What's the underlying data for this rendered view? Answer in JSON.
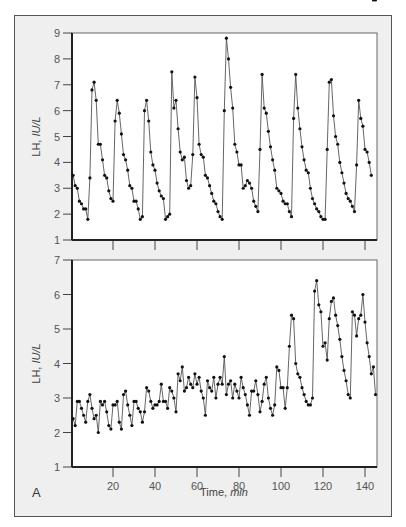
{
  "panel_label": "A",
  "colors": {
    "frame_bg": "#efefef",
    "plot_bg": "#ffffff",
    "line": "#555555",
    "marker": "#111111",
    "axis": "#222222"
  },
  "chart_data": [
    {
      "type": "line",
      "title": "",
      "xlabel": "",
      "ylabel": "LH, IU/L",
      "xlim": [
        0,
        145
      ],
      "ylim": [
        1,
        9
      ],
      "yticks": [
        1,
        2,
        3,
        4,
        5,
        6,
        7,
        8,
        9
      ],
      "xticks": [
        20,
        40,
        60,
        80,
        100,
        120,
        140
      ],
      "x": [
        1,
        2,
        3,
        4,
        5,
        6,
        7,
        8,
        9,
        10,
        11,
        12,
        13,
        14,
        15,
        16,
        17,
        18,
        19,
        20,
        21,
        22,
        23,
        24,
        25,
        26,
        27,
        28,
        29,
        30,
        31,
        32,
        33,
        34,
        35,
        36,
        37,
        38,
        39,
        40,
        41,
        42,
        43,
        44,
        45,
        46,
        47,
        48,
        49,
        50,
        51,
        52,
        53,
        54,
        55,
        56,
        57,
        58,
        59,
        60,
        61,
        62,
        63,
        64,
        65,
        66,
        67,
        68,
        69,
        70,
        71,
        72,
        73,
        74,
        75,
        76,
        77,
        78,
        79,
        80,
        81,
        82,
        83,
        84,
        85,
        86,
        87,
        88,
        89,
        90,
        91,
        92,
        93,
        94,
        95,
        96,
        97,
        98,
        99,
        100,
        101,
        102,
        103,
        104,
        105,
        106,
        107,
        108,
        109,
        110,
        111,
        112,
        113,
        114,
        115,
        116,
        117,
        118,
        119,
        120,
        121,
        122,
        123,
        124,
        125,
        126,
        127,
        128,
        129,
        130,
        131,
        132,
        133,
        134,
        135,
        136,
        137,
        138,
        139,
        140,
        141,
        142,
        143,
        144,
        145
      ],
      "series": [
        {
          "name": "LH",
          "values": [
            3.5,
            3.1,
            3.0,
            2.5,
            2.4,
            2.2,
            2.2,
            1.8,
            3.4,
            6.8,
            7.1,
            6.4,
            4.7,
            4.7,
            4.1,
            3.5,
            3.4,
            2.9,
            2.6,
            2.5,
            5.6,
            6.4,
            5.9,
            5.1,
            4.3,
            4.1,
            3.7,
            3.1,
            3.0,
            2.5,
            2.5,
            2.2,
            1.8,
            1.9,
            6.0,
            6.4,
            5.6,
            4.4,
            3.9,
            3.7,
            3.2,
            2.9,
            2.7,
            2.6,
            1.8,
            1.9,
            2.0,
            7.5,
            6.1,
            6.4,
            5.3,
            4.4,
            4.1,
            4.2,
            3.3,
            3.0,
            3.1,
            4.3,
            7.3,
            6.5,
            4.7,
            4.3,
            4.2,
            3.5,
            3.4,
            3.1,
            2.8,
            2.5,
            2.4,
            2.1,
            1.9,
            1.8,
            6.0,
            8.8,
            8.0,
            6.9,
            6.1,
            4.7,
            4.4,
            3.9,
            3.9,
            3.0,
            3.1,
            3.3,
            3.2,
            3.0,
            2.5,
            2.3,
            2.1,
            4.5,
            7.4,
            6.1,
            5.9,
            5.2,
            4.6,
            4.1,
            3.7,
            3.0,
            2.9,
            2.8,
            2.5,
            2.4,
            2.4,
            2.1,
            1.9,
            5.7,
            7.4,
            6.1,
            5.3,
            4.6,
            4.1,
            3.7,
            3.6,
            3.0,
            2.6,
            2.4,
            2.2,
            2.1,
            1.9,
            1.8,
            1.8,
            4.5,
            7.1,
            7.2,
            5.8,
            5.0,
            4.7,
            4.0,
            3.6,
            3.2,
            2.8,
            2.6,
            2.5,
            2.3,
            2.1,
            3.9,
            6.4,
            5.7,
            5.4,
            4.5,
            4.4,
            4.0,
            3.5
          ]
        }
      ]
    },
    {
      "type": "line",
      "title": "",
      "xlabel": "Time, min",
      "ylabel": "LH, IU/L",
      "xlim": [
        0,
        145
      ],
      "ylim": [
        1,
        7
      ],
      "yticks": [
        1,
        2,
        3,
        4,
        5,
        6,
        7
      ],
      "xticks": [
        20,
        40,
        60,
        80,
        100,
        120,
        140
      ],
      "x": [
        1,
        2,
        3,
        4,
        5,
        6,
        7,
        8,
        9,
        10,
        11,
        12,
        13,
        14,
        15,
        16,
        17,
        18,
        19,
        20,
        21,
        22,
        23,
        24,
        25,
        26,
        27,
        28,
        29,
        30,
        31,
        32,
        33,
        34,
        35,
        36,
        37,
        38,
        39,
        40,
        41,
        42,
        43,
        44,
        45,
        46,
        47,
        48,
        49,
        50,
        51,
        52,
        53,
        54,
        55,
        56,
        57,
        58,
        59,
        60,
        61,
        62,
        63,
        64,
        65,
        66,
        67,
        68,
        69,
        70,
        71,
        72,
        73,
        74,
        75,
        76,
        77,
        78,
        79,
        80,
        81,
        82,
        83,
        84,
        85,
        86,
        87,
        88,
        89,
        90,
        91,
        92,
        93,
        94,
        95,
        96,
        97,
        98,
        99,
        100,
        101,
        102,
        103,
        104,
        105,
        106,
        107,
        108,
        109,
        110,
        111,
        112,
        113,
        114,
        115,
        116,
        117,
        118,
        119,
        120,
        121,
        122,
        123,
        124,
        125,
        126,
        127,
        128,
        129,
        130,
        131,
        132,
        133,
        134,
        135,
        136,
        137,
        138,
        139,
        140,
        141,
        142,
        143,
        144,
        145
      ],
      "series": [
        {
          "name": "LH",
          "values": [
            2.4,
            2.2,
            2.9,
            2.9,
            2.7,
            2.5,
            2.3,
            2.9,
            3.1,
            2.7,
            2.4,
            2.5,
            2.0,
            2.9,
            2.8,
            2.9,
            2.6,
            2.2,
            2.1,
            2.8,
            2.8,
            2.9,
            2.3,
            2.1,
            3.1,
            3.2,
            2.8,
            2.5,
            2.2,
            2.9,
            2.9,
            2.7,
            2.6,
            2.3,
            2.6,
            3.3,
            3.2,
            2.9,
            2.7,
            2.8,
            2.8,
            2.9,
            3.4,
            2.9,
            2.9,
            2.7,
            3.3,
            3.2,
            3.0,
            2.6,
            3.7,
            3.5,
            3.9,
            3.2,
            3.3,
            3.6,
            3.4,
            3.3,
            3.7,
            3.4,
            3.6,
            3.2,
            3.0,
            2.5,
            3.5,
            3.3,
            3.2,
            3.6,
            3.0,
            3.4,
            3.6,
            3.4,
            4.2,
            3.1,
            3.4,
            3.5,
            3.0,
            3.4,
            3.2,
            3.0,
            3.6,
            3.3,
            3.1,
            2.8,
            2.5,
            3.2,
            3.2,
            3.5,
            3.1,
            2.6,
            2.9,
            3.4,
            3.6,
            3.0,
            2.7,
            2.5,
            2.8,
            3.9,
            3.8,
            3.3,
            3.3,
            2.7,
            3.3,
            4.5,
            5.4,
            5.3,
            4.0,
            3.7,
            3.6,
            3.3,
            3.1,
            2.9,
            2.8,
            2.8,
            3.0,
            6.1,
            6.4,
            5.7,
            5.5,
            4.5,
            4.6,
            4.1,
            5.3,
            5.8,
            5.9,
            5.4,
            5.1,
            4.7,
            4.2,
            3.8,
            3.5,
            3.1,
            3.0,
            5.5,
            5.4,
            4.8,
            5.3,
            5.4,
            6.0,
            5.2,
            4.6,
            4.2,
            3.7,
            3.9,
            3.1,
            3.2,
            3.0,
            4.1,
            5.7,
            5.3,
            5.3,
            5.3,
            5.4,
            6.0,
            6.3
          ]
        }
      ]
    }
  ]
}
